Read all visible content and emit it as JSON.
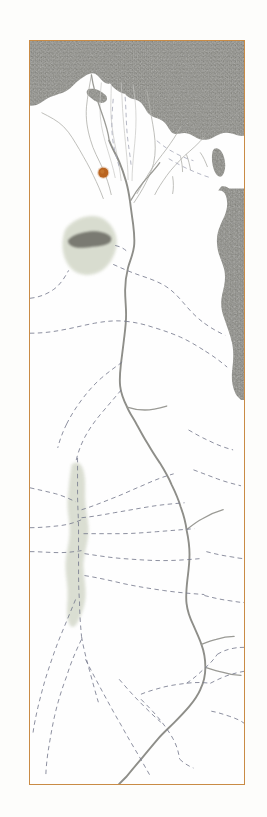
{
  "figure": {
    "kind": "historical-map",
    "title": "Map of Egypt: Nile Valley, Delta and Western Desert Oases",
    "frame": {
      "border_color": "#c98b45",
      "left": 29,
      "top": 40,
      "width": 216,
      "height": 745
    },
    "background_color": "#fdfdfb",
    "paper_color": "#fefefe"
  },
  "legend_colors": {
    "sea": "#8b8b85",
    "sea_texture": "#9a9a94",
    "river": "#8f8f8a",
    "route_dashed": "#7a7d90",
    "oasis_fill": "#d6dacb",
    "lake": "#6f6f68",
    "city_marker": "#b9641f",
    "frame": "#c98b45",
    "land": "#ffffff"
  },
  "features": {
    "seas": [
      {
        "name": "Mediterranean Sea",
        "position": "top",
        "fill": "#8b8b85"
      },
      {
        "name": "Red Sea and Gulf of Suez",
        "position": "right",
        "fill": "#8b8b85"
      },
      {
        "name": "Gulf of Aqaba",
        "position": "upper-right",
        "fill": "#8b8b85"
      }
    ],
    "river": {
      "name": "Nile River",
      "color": "#8f8f8a",
      "style": "solid-wavy"
    },
    "delta": {
      "name": "Nile Delta",
      "branches": 6,
      "color": "#b5b5b0"
    },
    "oases": [
      {
        "name": "Faiyum",
        "fill": "#d6dacb",
        "lake": "Lake Moeris",
        "lake_fill": "#6f6f68"
      },
      {
        "name": "Kharga Oasis",
        "fill": "#d6dacb",
        "lake": null,
        "lake_fill": null
      }
    ],
    "city_markers": [
      {
        "name": "Memphis",
        "color": "#b9641f",
        "x": 103,
        "y": 172,
        "radius": 5.5
      }
    ],
    "routes": {
      "name": "Desert caravan routes",
      "color": "#7a7d90",
      "style": "dashed",
      "count": 22
    }
  }
}
